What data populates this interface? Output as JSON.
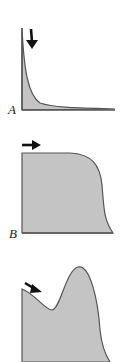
{
  "figure": {
    "panels": [
      {
        "label": "A",
        "description": "sharp decay curve, arrow pointing down",
        "arrow_direction": "down"
      },
      {
        "label": "B",
        "description": "plateau curve then drop, arrow pointing right",
        "arrow_direction": "right"
      },
      {
        "label": "",
        "description": "dip then peak curve, arrow pointing down-right",
        "arrow_direction": "down-right"
      }
    ],
    "colors": {
      "fill": "#c4c4c4",
      "stroke": "#555555",
      "arrow": "#111111"
    }
  }
}
